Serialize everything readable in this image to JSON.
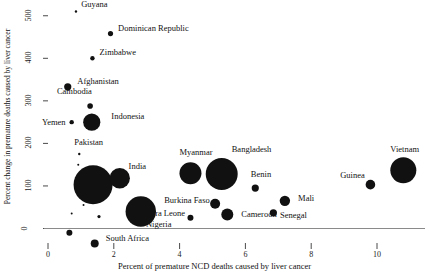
{
  "chart_data": {
    "type": "scatter",
    "title": "",
    "xlabel": "Percent of premature NCD deaths caused by liver cancer",
    "ylabel": "Percent change in premature deaths caused by liver cancer",
    "xlim": [
      -0.4,
      11.6
    ],
    "ylim": [
      -30,
      520
    ],
    "xticks": [
      0,
      2,
      4,
      6,
      8,
      10
    ],
    "xtick_labels": [
      "0",
      "2",
      "4",
      "6",
      "8",
      "10"
    ],
    "yticks": [
      0,
      100,
      200,
      300,
      400,
      500
    ],
    "ytick_labels": [
      "0",
      "100",
      "200",
      "300",
      "400",
      "500"
    ],
    "grid": false,
    "legend": "none",
    "size_encoding": "bubble area scaled by population/deaths",
    "points": [
      {
        "label": "Guyana",
        "x": 0.85,
        "y": 510,
        "r": 1.2,
        "label_dx": 4,
        "label_dy": -6
      },
      {
        "label": "Dominican Republic",
        "x": 1.9,
        "y": 458,
        "r": 2.6,
        "label_dx": 5,
        "label_dy": -5
      },
      {
        "label": "Zimbabwe",
        "x": 1.35,
        "y": 400,
        "r": 2.2,
        "label_dx": 5,
        "label_dy": -5
      },
      {
        "label": "Afghanistan",
        "x": 0.6,
        "y": 333,
        "r": 3.6,
        "label_dx": 6,
        "label_dy": -5
      },
      {
        "label": "Cambodia",
        "x": 1.28,
        "y": 288,
        "r": 2.8,
        "label_dx": -36,
        "label_dy": -14
      },
      {
        "label": "Indonesia",
        "x": 1.33,
        "y": 250,
        "r": 8.6,
        "label_dx": 11,
        "label_dy": -5
      },
      {
        "label": "Yemen",
        "x": 0.72,
        "y": 250,
        "r": 2.2,
        "label_dx": -32,
        "label_dy": 1
      },
      {
        "label": "Pakistan",
        "x": 0.92,
        "y": 150,
        "r": 1.0,
        "label_dx": -5,
        "label_dy": -22
      },
      {
        "label": "India",
        "x": 1.37,
        "y": 103,
        "r": 19.5,
        "label_dx": 16,
        "label_dy": -18
      },
      {
        "label": "Myanmar",
        "x": 4.33,
        "y": 130,
        "r": 11.0,
        "label_dx": -22,
        "label_dy": -20
      },
      {
        "label": "Bangladesh",
        "x": 5.28,
        "y": 128,
        "r": 16.0,
        "label_dx": -6,
        "label_dy": -24
      },
      {
        "label": "Vietnam",
        "x": 10.8,
        "y": 137,
        "r": 13.0,
        "label_dx": -26,
        "label_dy": -20
      },
      {
        "label": "Guinea",
        "x": 9.8,
        "y": 103,
        "r": 4.8,
        "label_dx": -35,
        "label_dy": -9
      },
      {
        "label": "Benin",
        "x": 6.3,
        "y": 95,
        "r": 3.6,
        "label_dx": -8,
        "label_dy": -13
      },
      {
        "label": "Mali",
        "x": 7.2,
        "y": 65,
        "r": 5.2,
        "label_dx": 8,
        "label_dy": -2
      },
      {
        "label": "Burkina Faso",
        "x": 5.08,
        "y": 58,
        "r": 5.0,
        "label_dx": -56,
        "label_dy": -3
      },
      {
        "label": "Senegal",
        "x": 6.85,
        "y": 37,
        "r": 3.6,
        "label_dx": 3,
        "label_dy": 3
      },
      {
        "label": "Sierra Leone",
        "x": 4.33,
        "y": 25,
        "r": 3.0,
        "label_dx": -52,
        "label_dy": -4
      },
      {
        "label": "Cameroon",
        "x": 5.45,
        "y": 33,
        "r": 6.0,
        "label_dx": 8,
        "label_dy": 1
      },
      {
        "label": "Nigeria",
        "x": 2.82,
        "y": 40,
        "r": 15.2,
        "label_dx": -10,
        "label_dy": 14
      },
      {
        "label": "South Africa",
        "x": 1.42,
        "y": -35,
        "r": 4.0,
        "label_dx": 7,
        "label_dy": -4
      },
      {
        "label": "",
        "x": 0.65,
        "y": -10,
        "r": 3.0,
        "label_dx": 0,
        "label_dy": 0
      },
      {
        "label": "",
        "x": 1.08,
        "y": 55,
        "r": 1.0,
        "label_dx": 0,
        "label_dy": 0
      },
      {
        "label": "",
        "x": 1.55,
        "y": 28,
        "r": 1.6,
        "label_dx": 0,
        "label_dy": 0
      },
      {
        "label": "",
        "x": 0.72,
        "y": 35,
        "r": 1.0,
        "label_dx": 0,
        "label_dy": 0
      },
      {
        "label": "",
        "x": 2.18,
        "y": 118,
        "r": 10.2,
        "label_dx": 0,
        "label_dy": 0
      },
      {
        "label": "",
        "x": 0.95,
        "y": 175,
        "r": 1.2,
        "label_dx": 0,
        "label_dy": 0
      }
    ]
  },
  "colors": {
    "bubble": "#111111",
    "axis": "#8a8a8a",
    "text": "#111111",
    "background": "#ffffff"
  }
}
